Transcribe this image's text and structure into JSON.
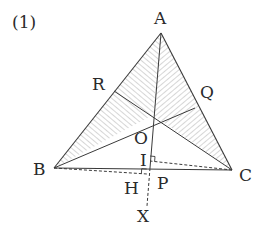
{
  "problem_number": "(1)",
  "colors": {
    "line": "#3a3a3a",
    "hatch": "#8a8a8a",
    "label": "#2a2a2a",
    "background": "#ffffff"
  },
  "points": {
    "A": {
      "label": "A",
      "x": 161,
      "y": 33
    },
    "B": {
      "label": "B",
      "x": 54,
      "y": 168
    },
    "C": {
      "label": "C",
      "x": 232,
      "y": 170
    },
    "O": {
      "label": "O",
      "x": 153,
      "y": 115
    },
    "R": {
      "label": "R",
      "x": 114,
      "y": 91
    },
    "Q": {
      "label": "Q",
      "x": 195,
      "y": 108
    },
    "I": {
      "label": "I",
      "x": 149,
      "y": 161
    },
    "P": {
      "label": "P",
      "x": 150,
      "y": 168
    },
    "H": {
      "label": "H",
      "x": 146,
      "y": 175
    },
    "X": {
      "label": "X",
      "x": 147,
      "y": 212
    }
  },
  "labels": {
    "A": "A",
    "B": "B",
    "C": "C",
    "O": "O",
    "R": "R",
    "Q": "Q",
    "I": "I",
    "P": "P",
    "H": "H",
    "X": "X"
  },
  "shaded_regions": [
    "ARO",
    "AOQ",
    "BOR",
    "COQ"
  ],
  "solid_segments": [
    "AB",
    "AC",
    "BC",
    "AO",
    "OP",
    "BO-Q",
    "CO-R",
    "BO",
    "CO"
  ],
  "dashed_segments": [
    "BH",
    "CI",
    "PX"
  ],
  "right_angle_marks": [
    "I",
    "H"
  ]
}
